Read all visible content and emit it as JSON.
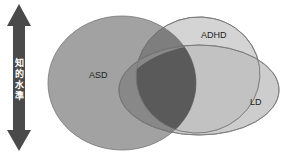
{
  "axis": {
    "label_chars": [
      "知",
      "的",
      "水",
      "準"
    ],
    "label": "知的水準",
    "arrow_color": "#4a4a4a"
  },
  "sets": [
    {
      "name": "ASD",
      "fill": "#9a9a9a"
    },
    {
      "name": "ADHD",
      "fill": "#cfcfcf"
    },
    {
      "name": "LD",
      "fill": "#bdbdbd"
    }
  ],
  "overlap_color": "#555555"
}
